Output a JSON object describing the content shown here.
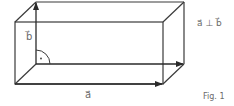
{
  "figure": {
    "caption": "Fig. 1",
    "relation": "a⃗ ⊥ b⃗",
    "vector_a_label": "a⃗",
    "vector_b_label": "b⃗",
    "right_angle_mark": "·",
    "colors": {
      "line": "#3a3a3a",
      "arrow": "#2a2a2a",
      "text": "#6a6a6a"
    }
  },
  "diagram": {
    "shape": "cuboid",
    "front_face": {
      "x1": 15,
      "y1": 22,
      "x2": 163,
      "y2": 84
    },
    "back_offset": {
      "dx": 21,
      "dy": -20
    },
    "vectors": [
      {
        "name": "a",
        "from": [
          36,
          64
        ],
        "to": [
          184,
          64
        ],
        "note": "along back bottom edge"
      },
      {
        "name": "a",
        "from": [
          15,
          84
        ],
        "to": [
          163,
          84
        ],
        "note": "along front bottom edge"
      },
      {
        "name": "b",
        "from": [
          36,
          64
        ],
        "to": [
          36,
          2
        ],
        "note": "vertical back-left edge"
      }
    ],
    "annotations": [
      "right angle between a and b at back-bottom-left corner"
    ]
  }
}
